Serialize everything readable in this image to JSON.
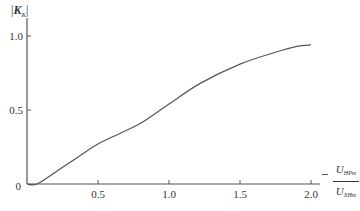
{
  "chart_data": {
    "type": "line",
    "title": "",
    "ylabel": "|K_K|",
    "ylabel_parts": {
      "main": "K",
      "sub": "K"
    },
    "xlabel": "U_HPm / U_XHm",
    "xlabel_parts": {
      "num_main": "U",
      "num_sub": "HPm",
      "den_main": "U",
      "den_sub": "XHm"
    },
    "xlim": [
      0,
      2.1
    ],
    "ylim": [
      0,
      1.05
    ],
    "xticks": [
      0.5,
      1.0,
      1.5,
      2.0
    ],
    "xtick_labels": [
      "0.5",
      "1.0",
      "1.5",
      "2.0"
    ],
    "yticks": [
      0.5,
      1.0
    ],
    "ytick_labels": [
      "0.5",
      "1.0"
    ],
    "origin_label": "0",
    "grid": false,
    "legend": null,
    "series": [
      {
        "name": "|K_K|",
        "x": [
          0.0,
          0.07,
          0.2,
          0.37,
          0.5,
          0.65,
          0.8,
          1.0,
          1.22,
          1.5,
          1.75,
          1.9,
          2.0
        ],
        "values": [
          0.0,
          0.0,
          0.08,
          0.19,
          0.27,
          0.34,
          0.41,
          0.54,
          0.68,
          0.81,
          0.89,
          0.93,
          0.94
        ]
      }
    ]
  }
}
